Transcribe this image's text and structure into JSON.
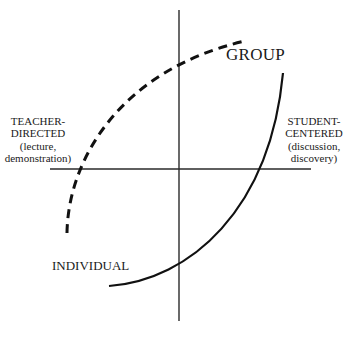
{
  "diagram": {
    "axes": {
      "horizontal": "teacher-directed to student-centered",
      "vertical": "individual to group"
    },
    "labels": {
      "group": "GROUP",
      "individual": "INDIVIDUAL",
      "teacher_title_1": "TEACHER-",
      "teacher_title_2": "DIRECTED",
      "teacher_sub_1": "(lecture,",
      "teacher_sub_2": "demonstration)",
      "student_title_1": "STUDENT-",
      "student_title_2": "CENTERED",
      "student_sub_1": "(discussion,",
      "student_sub_2": "discovery)"
    },
    "curves": [
      {
        "name": "dashed-curve",
        "style": "dashed",
        "from": "lower-left (teacher-directed, individual)",
        "to": "upper-right (group)"
      },
      {
        "name": "solid-curve",
        "style": "solid",
        "from": "lower (individual)",
        "to": "upper-right (student-centered, group)"
      }
    ],
    "colors": {
      "ink": "#1a1a1a",
      "background": "#ffffff"
    }
  }
}
